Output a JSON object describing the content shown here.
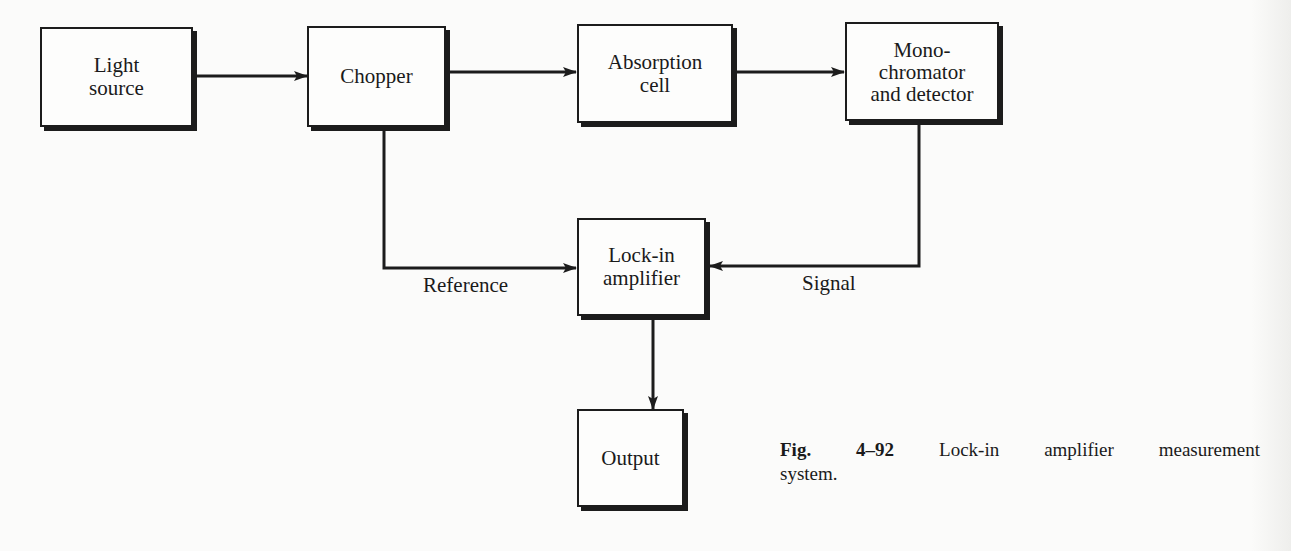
{
  "figure": {
    "type": "block-diagram",
    "blocks": [
      {
        "id": "light-source",
        "label": "Light\nsource"
      },
      {
        "id": "chopper",
        "label": "Chopper"
      },
      {
        "id": "absorption-cell",
        "label": "Absorption\ncell"
      },
      {
        "id": "monochromator",
        "label": "Mono-\nchromator\nand detector"
      },
      {
        "id": "lock-in",
        "label": "Lock-in\namplifier"
      },
      {
        "id": "output",
        "label": "Output"
      }
    ],
    "connections": [
      {
        "from": "light-source",
        "to": "chopper"
      },
      {
        "from": "chopper",
        "to": "absorption-cell"
      },
      {
        "from": "absorption-cell",
        "to": "monochromator"
      },
      {
        "from": "chopper",
        "to": "lock-in",
        "label": "Reference"
      },
      {
        "from": "monochromator",
        "to": "lock-in",
        "label": "Signal"
      },
      {
        "from": "lock-in",
        "to": "output"
      }
    ],
    "edge_labels": {
      "reference": "Reference",
      "signal": "Signal"
    },
    "caption": {
      "number": "Fig. 4–92",
      "line1_text": "Lock-in amplifier measurement",
      "line2_text": "system."
    }
  }
}
